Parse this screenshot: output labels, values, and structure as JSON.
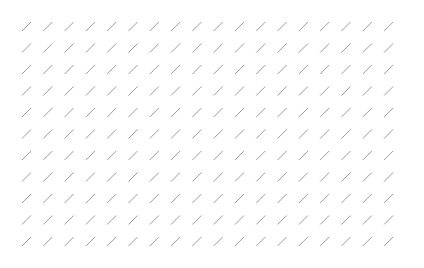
{
  "canvas": {
    "width": 424,
    "height": 268,
    "background_color": "#ffffff",
    "description": "blank white canvas tiled with repeating diagonal hatch marks"
  },
  "pattern": {
    "name": "diagonal-slash-hatch",
    "glyph": "/",
    "mark_color": "#9a9aa0",
    "stroke_width": 1,
    "columns": 18,
    "rows": 11,
    "total_marks": 198,
    "origin_x": 22,
    "origin_y": 22,
    "spacing_x": 21.3,
    "spacing_y": 21.5,
    "mark_length_x": 9,
    "mark_length_y": 9,
    "direction": "lower-left to upper-right",
    "angle_degrees": 45
  }
}
